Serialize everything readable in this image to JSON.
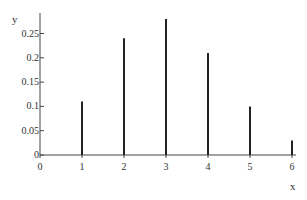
{
  "chart_data": {
    "type": "bar",
    "style": "stem",
    "title": "",
    "xlabel": "x",
    "ylabel": "y",
    "categories": [
      1,
      2,
      3,
      4,
      5,
      6
    ],
    "values": [
      0.11,
      0.24,
      0.28,
      0.21,
      0.1,
      0.03
    ],
    "x_ticks": [
      "0",
      "1",
      "2",
      "3",
      "4",
      "5",
      "6"
    ],
    "y_ticks": [
      "0",
      "0.05",
      "0.1",
      "0.15",
      "0.2",
      "0.25"
    ],
    "xlim": [
      0,
      6
    ],
    "ylim": [
      0,
      0.29
    ],
    "grid": false,
    "legend": null,
    "colors": {
      "bar": "#222222",
      "axis": "#444444"
    }
  }
}
